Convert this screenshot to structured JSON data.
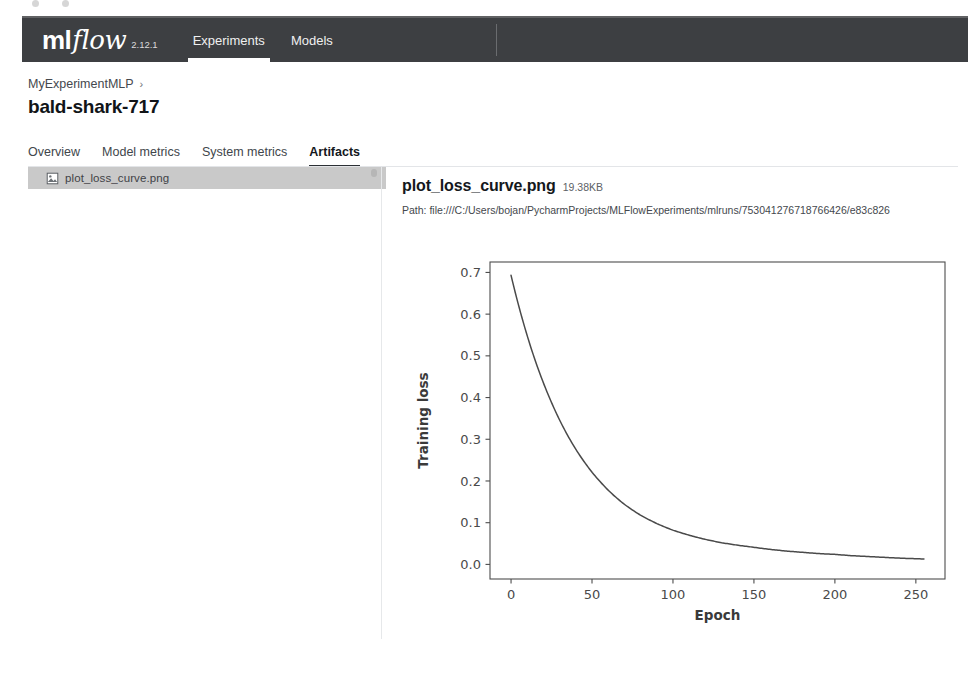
{
  "navbar": {
    "brand_ml": "ml",
    "brand_flow": "flow",
    "version": "2.12.1",
    "links": [
      {
        "label": "Experiments",
        "active": true
      },
      {
        "label": "Models",
        "active": false
      }
    ],
    "background_color": "#3d3f42"
  },
  "breadcrumb": {
    "parent": "MyExperimentMLP",
    "separator": "›"
  },
  "page_title": "bald-shark-717",
  "tabs": [
    {
      "label": "Overview",
      "active": false
    },
    {
      "label": "Model metrics",
      "active": false
    },
    {
      "label": "System metrics",
      "active": false
    },
    {
      "label": "Artifacts",
      "active": true
    }
  ],
  "file_tree": {
    "items": [
      {
        "name": "plot_loss_curve.png",
        "icon": "image-file-icon",
        "selected": true
      }
    ],
    "selected_background": "#c9c9c9"
  },
  "preview": {
    "filename": "plot_loss_curve.png",
    "size": "19.38KB",
    "path_label": "Path:",
    "path_value": "file:///C:/Users/bojan/PycharmProjects/MLFlowExperiments/mlruns/753041276718766426/e83c826"
  },
  "chart_data": {
    "type": "line",
    "title": "",
    "xlabel": "Epoch",
    "ylabel": "Training loss",
    "xlim": [
      -13,
      268
    ],
    "ylim": [
      -0.035,
      0.725
    ],
    "xticks": [
      0,
      50,
      100,
      150,
      200,
      250
    ],
    "xtick_labels": [
      "0",
      "50",
      "100",
      "150",
      "200",
      "250"
    ],
    "yticks": [
      0.0,
      0.1,
      0.2,
      0.3,
      0.4,
      0.5,
      0.6,
      0.7
    ],
    "ytick_labels": [
      "0.0",
      "0.1",
      "0.2",
      "0.3",
      "0.4",
      "0.5",
      "0.6",
      "0.7"
    ],
    "grid": false,
    "legend": null,
    "line_color": "#4a4a4a",
    "series": [
      {
        "name": "Training loss",
        "x": [
          0,
          5,
          10,
          15,
          20,
          25,
          30,
          35,
          40,
          45,
          50,
          60,
          70,
          80,
          90,
          100,
          110,
          120,
          130,
          140,
          150,
          160,
          170,
          180,
          190,
          200,
          210,
          220,
          230,
          240,
          255
        ],
        "y": [
          0.693,
          0.616,
          0.548,
          0.488,
          0.435,
          0.388,
          0.346,
          0.309,
          0.276,
          0.247,
          0.221,
          0.178,
          0.144,
          0.118,
          0.098,
          0.082,
          0.07,
          0.06,
          0.052,
          0.046,
          0.041,
          0.036,
          0.032,
          0.029,
          0.026,
          0.024,
          0.021,
          0.019,
          0.017,
          0.015,
          0.013
        ]
      }
    ]
  }
}
